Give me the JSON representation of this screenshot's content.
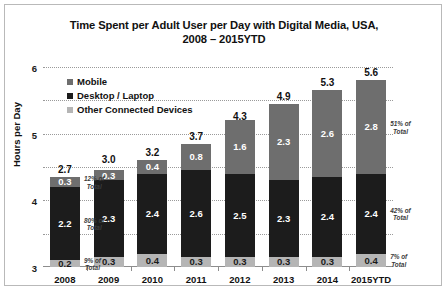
{
  "chart_data": {
    "type": "bar",
    "subtype": "stacked-bar",
    "title": "Time Spent per Adult User per Day with Digital Media, USA, 2008 – 2015YTD",
    "title_line1": "Time Spent per Adult User per Day with Digital Media, USA,",
    "title_line2": "2008 – 2015YTD",
    "xlabel": "",
    "ylabel": "Hours per Day",
    "ylim": [
      0,
      6
    ],
    "yticks": [
      "0",
      "1",
      "2",
      "3",
      "4",
      "5",
      "6"
    ],
    "grid": "horizontal-dotted",
    "legend_position": "inside-top-left",
    "categories": [
      "2008",
      "2009",
      "2010",
      "2011",
      "2012",
      "2013",
      "2014",
      "2015YTD"
    ],
    "series": [
      {
        "name": "Mobile",
        "color": "#6e6e6e",
        "values": [
          0.3,
          0.3,
          0.4,
          0.8,
          1.6,
          2.3,
          2.6,
          2.8
        ]
      },
      {
        "name": "Desktop / Laptop",
        "color": "#1c1c1c",
        "values": [
          2.2,
          2.3,
          2.4,
          2.6,
          2.5,
          2.3,
          2.4,
          2.4
        ]
      },
      {
        "name": "Other Connected Devices",
        "color": "#b5b5b5",
        "values": [
          0.2,
          0.3,
          0.4,
          0.3,
          0.3,
          0.3,
          0.3,
          0.4
        ]
      }
    ],
    "totals": [
      2.7,
      3.0,
      3.2,
      3.7,
      4.3,
      4.9,
      5.3,
      5.6
    ],
    "annotations": [
      {
        "text_line1": "12% of",
        "text_line2": "Total",
        "series": "Mobile",
        "category": "2008",
        "side": "right"
      },
      {
        "text_line1": "80% of",
        "text_line2": "Total",
        "series": "Desktop / Laptop",
        "category": "2008",
        "side": "right"
      },
      {
        "text_line1": "9% of",
        "text_line2": "Total",
        "series": "Other Connected Devices",
        "category": "2008",
        "side": "right"
      },
      {
        "text_line1": "51% of",
        "text_line2": "Total",
        "series": "Mobile",
        "category": "2015YTD",
        "side": "right"
      },
      {
        "text_line1": "42% of",
        "text_line2": "Total",
        "series": "Desktop / Laptop",
        "category": "2015YTD",
        "side": "right"
      },
      {
        "text_line1": "7% of",
        "text_line2": "Total",
        "series": "Other Connected Devices",
        "category": "2015YTD",
        "side": "right"
      }
    ]
  }
}
